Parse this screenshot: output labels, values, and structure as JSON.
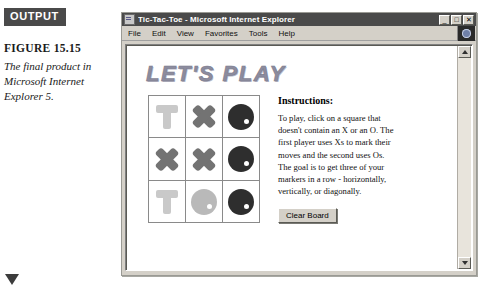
{
  "margin": {
    "output_badge": "OUTPUT",
    "figure_label": "FIGURE 15.15",
    "figure_caption": "The final product in Microsoft Internet Explorer 5."
  },
  "browser": {
    "title": "Tic-Tac-Toe - Microsoft Internet Explorer",
    "window_buttons": {
      "minimize": "_",
      "maximize": "□",
      "close": "✕"
    },
    "menu": [
      {
        "label": "File"
      },
      {
        "label": "Edit"
      },
      {
        "label": "View"
      },
      {
        "label": "Favorites"
      },
      {
        "label": "Tools"
      },
      {
        "label": "Help"
      }
    ]
  },
  "page": {
    "headline": "LET'S PLAY",
    "board": {
      "rows": [
        [
          {
            "state": "empty",
            "label": ""
          },
          {
            "state": "x",
            "label": "X"
          },
          {
            "state": "o",
            "label": "O"
          }
        ],
        [
          {
            "state": "x",
            "label": "X"
          },
          {
            "state": "x",
            "label": "X"
          },
          {
            "state": "o",
            "label": "O"
          }
        ],
        [
          {
            "state": "empty",
            "label": ""
          },
          {
            "state": "o-light",
            "label": "O"
          },
          {
            "state": "o",
            "label": "O"
          }
        ]
      ]
    },
    "instructions": {
      "title": "Instructions:",
      "body": "To play, click on a square that doesn't contain an X or an O. The first player uses Xs to mark their moves and the second uses Os. The goal is to get three of your markers in a row - horizontally, vertically, or diagonally.",
      "clear_button": "Clear Board"
    }
  },
  "colors": {
    "titlebar": "#4a4a4a",
    "chrome": "#d4d0c8",
    "headline": "#8c8c9e",
    "mark_dark": "#2e2e2e",
    "mark_mid": "#737373",
    "mark_light": "#c4c4c4"
  }
}
